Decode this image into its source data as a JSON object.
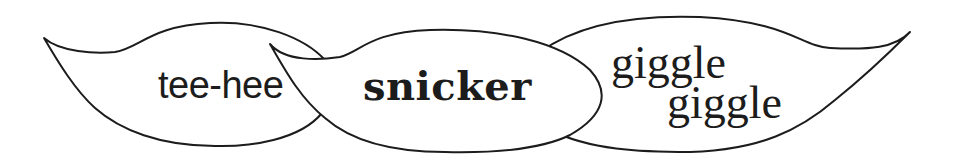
{
  "illustration": {
    "description": "Three overlapping speech bubbles with laughter words",
    "colors": {
      "background": "#ffffff",
      "outline": "#1c1c1c",
      "text": "#1c1c1c"
    },
    "bubbles": [
      {
        "id": "tee-hee",
        "lines": [
          "tee-hee"
        ],
        "tail_direction": "up-left"
      },
      {
        "id": "snicker",
        "lines": [
          "snicker"
        ],
        "tail_direction": "up-left"
      },
      {
        "id": "giggle",
        "lines": [
          "giggle",
          "giggle"
        ],
        "tail_direction": "up-right"
      }
    ]
  }
}
